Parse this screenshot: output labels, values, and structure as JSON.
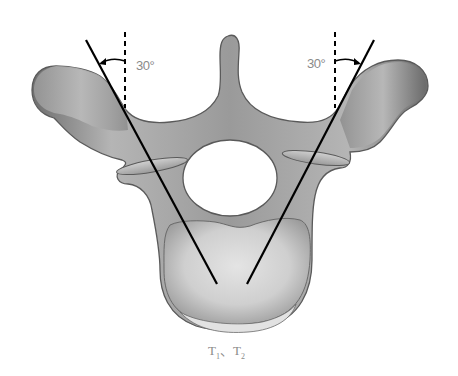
{
  "figure": {
    "left_angle_label": "30°",
    "right_angle_label": "30°",
    "caption": {
      "part1": "T",
      "sub1": "1",
      "sep": "、",
      "part2": "T",
      "sub2": "2"
    },
    "colors": {
      "bone_fill": "#a9a9a9",
      "bone_dark": "#6f6f6f",
      "bone_light": "#d8d8d8",
      "outline": "#5a5a5a",
      "line": "#000000",
      "label": "#8a8a8a"
    }
  }
}
